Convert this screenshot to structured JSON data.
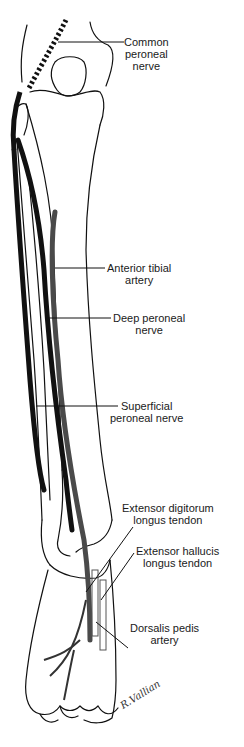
{
  "diagram": {
    "colors": {
      "nerve": "#111111",
      "artery": "#4a4a4a",
      "outline": "#111111",
      "background": "#ffffff"
    },
    "labels": [
      {
        "id": "common-peroneal-nerve",
        "line1": "Common",
        "line2": "peroneal",
        "line3": "nerve"
      },
      {
        "id": "anterior-tibial-artery",
        "line1": "Anterior tibial",
        "line2": "artery"
      },
      {
        "id": "deep-peroneal-nerve",
        "line1": "Deep peroneal",
        "line2": "nerve"
      },
      {
        "id": "superficial-peroneal-nerve",
        "line1": "Superficial",
        "line2": "peroneal nerve"
      },
      {
        "id": "extensor-digitorum-longus-tendon",
        "line1": "Extensor digitorum",
        "line2": "longus tendon"
      },
      {
        "id": "extensor-hallucis-longus-tendon",
        "line1": "Extensor hallucis",
        "line2": "longus tendon"
      },
      {
        "id": "dorsalis-pedis-artery",
        "line1": "Dorsalis pedis",
        "line2": "artery"
      }
    ],
    "signature": "R.Vallian"
  }
}
